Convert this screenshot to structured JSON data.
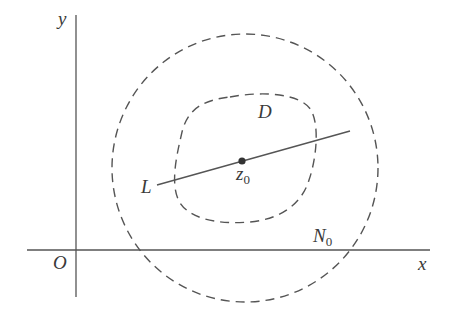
{
  "diagram": {
    "colors": {
      "stroke": "#555555",
      "text": "#3a3a3a",
      "background": "#ffffff"
    },
    "axes": {
      "x_label": "x",
      "y_label": "y",
      "origin_label": "O"
    },
    "labels": {
      "region": "D",
      "line": "L",
      "point_base": "z",
      "point_sub": "0",
      "neighborhood_base": "N",
      "neighborhood_sub": "0"
    },
    "elements": [
      {
        "name": "N0",
        "type": "dashed-circle",
        "description": "neighborhood circle around z0"
      },
      {
        "name": "D",
        "type": "dashed-closed-curve",
        "description": "domain region containing z0"
      },
      {
        "name": "L",
        "type": "line-segment",
        "description": "line through z0"
      },
      {
        "name": "z0",
        "type": "point",
        "description": "point inside D"
      }
    ]
  }
}
